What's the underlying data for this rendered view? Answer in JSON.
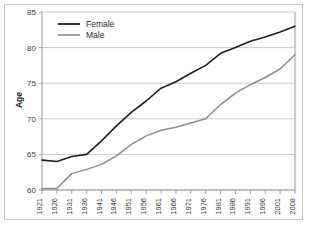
{
  "chart_data": {
    "type": "line",
    "title": "",
    "subtitle": "",
    "xlabel": "",
    "ylabel": "Age",
    "xlim": [
      1921,
      2008
    ],
    "ylim": [
      60,
      85
    ],
    "yticks": [
      60,
      65,
      70,
      75,
      80,
      85
    ],
    "grid": true,
    "legend_position": "top-left",
    "x": [
      1921,
      1926,
      1931,
      1936,
      1941,
      1946,
      1951,
      1956,
      1961,
      1966,
      1971,
      1976,
      1981,
      1986,
      1991,
      1996,
      2001,
      2008
    ],
    "categories": [
      "1921",
      "1926",
      "1931",
      "1936",
      "1941",
      "1946",
      "1951",
      "1956",
      "1961",
      "1966",
      "1971",
      "1976",
      "1981",
      "1986",
      "1991",
      "1996",
      "2001",
      "2008"
    ],
    "series": [
      {
        "name": "Female",
        "color": "#231f20",
        "values": [
          64.2,
          64.0,
          64.7,
          65.0,
          66.9,
          69.0,
          70.9,
          72.5,
          74.3,
          75.2,
          76.4,
          77.5,
          79.2,
          80.0,
          80.9,
          81.5,
          82.2,
          83.0
        ]
      },
      {
        "name": "Male",
        "color": "#8c8c8c",
        "values": [
          60.2,
          60.2,
          62.3,
          62.9,
          63.6,
          64.8,
          66.4,
          67.6,
          68.4,
          68.8,
          69.4,
          70.0,
          72.0,
          73.6,
          74.8,
          75.8,
          77.0,
          79.0
        ]
      }
    ],
    "annotations": []
  },
  "legend": {
    "items": [
      {
        "label": "Female",
        "color": "#231f20"
      },
      {
        "label": "Male",
        "color": "#8c8c8c"
      }
    ]
  },
  "axes": {
    "y_title": "Age",
    "y_tick_labels": [
      "60",
      "65",
      "70",
      "75",
      "80",
      "85"
    ],
    "x_tick_labels": [
      "1921",
      "1926",
      "1931",
      "1936",
      "1941",
      "1946",
      "1951",
      "1956",
      "1961",
      "1966",
      "1971",
      "1976",
      "1981",
      "1986",
      "1991",
      "1996",
      "2001",
      "2008"
    ]
  },
  "colors": {
    "background": "#ffffff",
    "frame": "#c9c9c9",
    "grid": "#b4b4b4",
    "axis": "#8f8f8f",
    "female": "#231f20",
    "male": "#8c8c8c",
    "tick_text": "#3a3a3a"
  }
}
